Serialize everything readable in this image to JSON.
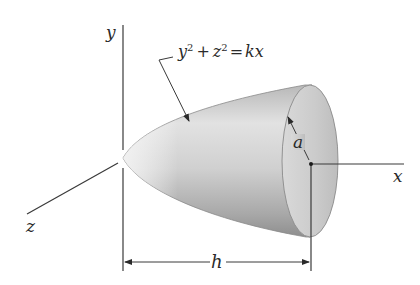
{
  "figure": {
    "type": "paraboloid-of-revolution",
    "axes": {
      "y_label": "y",
      "x_label": "x",
      "z_label": "z"
    },
    "equation": {
      "lhs_var1": "y",
      "lhs_exp1": "2",
      "plus": "+",
      "lhs_var2": "z",
      "lhs_exp2": "2",
      "equals": "=",
      "rhs": "kx",
      "full_text": "y² + z² = kx"
    },
    "dimensions": {
      "radius_label": "a",
      "length_label": "h"
    },
    "colors": {
      "line": "#3a3a3a",
      "surface_light": "#e6e6e6",
      "surface_mid": "#c8c8c8",
      "surface_dark": "#9a9a9a",
      "face_fill": "#cfcfcf",
      "background": "#ffffff"
    }
  }
}
